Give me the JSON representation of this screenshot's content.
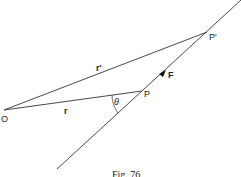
{
  "diagram": {
    "points": {
      "O": {
        "label": "O",
        "x": 4,
        "y": 110
      },
      "P": {
        "label": "P",
        "x": 142,
        "y": 91
      },
      "P_prime": {
        "label": "P'",
        "x": 207,
        "y": 32
      }
    },
    "vectors": {
      "r": {
        "label": "r"
      },
      "r_prime": {
        "label": "r'"
      },
      "F": {
        "label": "F"
      }
    },
    "angle": {
      "label": "θ"
    },
    "line_of_action": {
      "from": [
        57,
        169
      ],
      "to": [
        241,
        0
      ]
    },
    "caption": "Fig. 76",
    "colors": {
      "line": "#333333",
      "background": "#ffffff"
    }
  }
}
